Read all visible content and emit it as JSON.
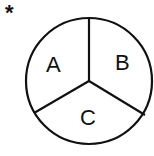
{
  "marker": "*",
  "diagram": {
    "type": "circle divided into three sectors",
    "sectors": [
      {
        "label": "A"
      },
      {
        "label": "B"
      },
      {
        "label": "C"
      }
    ]
  }
}
